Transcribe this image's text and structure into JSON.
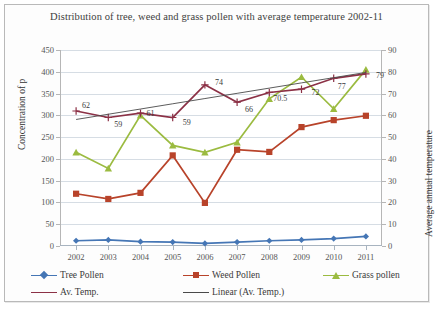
{
  "chart_data": {
    "type": "line",
    "title": "Distribution of tree, weed and grass pollen with average temperature 2002-11",
    "xlabel": "",
    "ylabel": "Concentration of p",
    "y2label": "Average annual temperature",
    "categories": [
      "2002",
      "2003",
      "2004",
      "2005",
      "2006",
      "2007",
      "2008",
      "2009",
      "2010",
      "2011"
    ],
    "ylim": [
      0,
      450
    ],
    "y2lim": [
      0,
      90
    ],
    "yticks": [
      0,
      50,
      100,
      150,
      200,
      250,
      300,
      350,
      400,
      450
    ],
    "y2ticks": [
      0,
      10,
      20,
      30,
      40,
      50,
      60,
      70,
      80,
      90
    ],
    "grid": true,
    "legend_position": "bottom",
    "series": [
      {
        "name": "Tree Pollen",
        "axis": "left",
        "color": "#4576b5",
        "marker": "diamond",
        "values": [
          12,
          14,
          10,
          9,
          6,
          9,
          12,
          14,
          17,
          22
        ]
      },
      {
        "name": "Weed Pollen",
        "axis": "left",
        "color": "#b8432a",
        "marker": "square",
        "values": [
          120,
          108,
          122,
          208,
          99,
          221,
          216,
          273,
          289,
          299
        ]
      },
      {
        "name": "Grass pollen",
        "axis": "left",
        "color": "#9bbb40",
        "marker": "triangle",
        "values": [
          215,
          178,
          300,
          231,
          215,
          238,
          338,
          388,
          315,
          405
        ]
      },
      {
        "name": "Av. Temp.",
        "axis": "right",
        "color": "#8c3146",
        "marker": "cross",
        "values": [
          62,
          59,
          61,
          59,
          74,
          66,
          70.5,
          72,
          77,
          79
        ],
        "data_labels": [
          "62",
          "59",
          "61",
          "59",
          "74",
          "66",
          "70.5",
          "72",
          "77",
          "79"
        ]
      },
      {
        "name": "Linear (Av. Temp.)",
        "axis": "right",
        "color": "#4a4a4a",
        "marker": "none",
        "trendline": true,
        "values": [
          58.1,
          60.5,
          62.9,
          65.3,
          67.7,
          70.1,
          72.5,
          74.9,
          77.3,
          79.7
        ]
      }
    ]
  }
}
